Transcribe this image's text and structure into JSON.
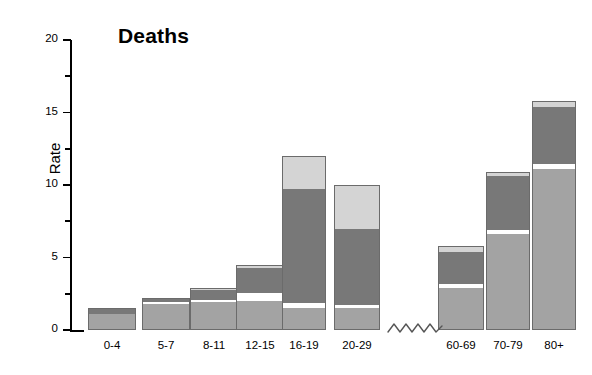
{
  "chart": {
    "title": "Deaths",
    "ylabel": "Rate",
    "y_ticks": [
      "0",
      "5",
      "10",
      "15",
      "20"
    ],
    "y_minor_ticks": [
      "2.5",
      "7.5",
      "12.5",
      "17.5"
    ],
    "axis_break_symbol": "squiggle-wave",
    "colors": {
      "segment_light": "#d4d4d4",
      "segment_dark": "#787878",
      "segment_medium": "#a3a3a3",
      "outline": "#6b6b6b",
      "axis": "#000000",
      "background": "#ffffff"
    }
  },
  "chart_data": {
    "type": "bar",
    "title": "Deaths",
    "xlabel": "",
    "ylabel": "Rate",
    "ylim": [
      0,
      20
    ],
    "grid": false,
    "legend": "none",
    "stacked": true,
    "axis_break_after_category": "20-29",
    "categories": [
      "0-4",
      "5-7",
      "8-11",
      "12-15",
      "16-19",
      "20-29",
      "60-69",
      "70-79",
      "80+"
    ],
    "series": [
      {
        "name": "bottom-segment",
        "color": "#a3a3a3",
        "values": [
          1.1,
          1.8,
          1.9,
          2.0,
          1.5,
          1.5,
          2.9,
          6.6,
          11.1
        ]
      },
      {
        "name": "middle-segment",
        "color": "#787878",
        "values": [
          0.4,
          0.4,
          0.4,
          0.6,
          8.2,
          5.4,
          2.2,
          4.0,
          4.2
        ]
      },
      {
        "name": "top-segment",
        "color": "#d4d4d4",
        "values": [
          0.0,
          0.0,
          0.2,
          1.9,
          2.3,
          3.0,
          0.4,
          0.3,
          0.5
        ]
      }
    ],
    "totals": [
      1.5,
      2.2,
      2.9,
      4.5,
      12.0,
      10.0,
      5.8,
      10.9,
      15.8
    ]
  },
  "bars": [
    {
      "label": "0-4",
      "x": 88,
      "width": 48,
      "total": 1.5,
      "segments": [
        {
          "kind": "medium",
          "from": 0.0,
          "to": 1.1
        },
        {
          "kind": "dark",
          "from": 1.1,
          "to": 1.5
        }
      ]
    },
    {
      "label": "5-7",
      "x": 142,
      "width": 48,
      "total": 2.2,
      "segments": [
        {
          "kind": "medium",
          "from": 0.0,
          "to": 1.8
        },
        {
          "kind": "gap",
          "from": 1.8,
          "to": 1.9
        },
        {
          "kind": "dark",
          "from": 1.9,
          "to": 2.2
        }
      ]
    },
    {
      "label": "8-11",
      "x": 190,
      "width": 48,
      "total": 2.9,
      "segments": [
        {
          "kind": "medium",
          "from": 0.0,
          "to": 1.9
        },
        {
          "kind": "gap",
          "from": 1.9,
          "to": 2.1
        },
        {
          "kind": "dark",
          "from": 2.1,
          "to": 2.75
        },
        {
          "kind": "light",
          "from": 2.75,
          "to": 2.9
        }
      ]
    },
    {
      "label": "12-15",
      "x": 236,
      "width": 48,
      "total": 4.5,
      "segments": [
        {
          "kind": "medium",
          "from": 0.0,
          "to": 2.0
        },
        {
          "kind": "gap",
          "from": 2.0,
          "to": 2.55
        },
        {
          "kind": "dark",
          "from": 2.55,
          "to": 4.3
        },
        {
          "kind": "light",
          "from": 4.3,
          "to": 4.5
        }
      ]
    },
    {
      "label": "16-19",
      "x": 282,
      "width": 44,
      "total": 12.0,
      "segments": [
        {
          "kind": "medium",
          "from": 0.0,
          "to": 1.5
        },
        {
          "kind": "gap",
          "from": 1.5,
          "to": 1.85
        },
        {
          "kind": "dark",
          "from": 1.85,
          "to": 9.7
        },
        {
          "kind": "light",
          "from": 9.7,
          "to": 12.0
        }
      ]
    },
    {
      "label": "20-29",
      "x": 334,
      "width": 46,
      "total": 10.0,
      "segments": [
        {
          "kind": "medium",
          "from": 0.0,
          "to": 1.5
        },
        {
          "kind": "gap",
          "from": 1.5,
          "to": 1.7
        },
        {
          "kind": "dark",
          "from": 1.7,
          "to": 7.0
        },
        {
          "kind": "light",
          "from": 7.0,
          "to": 10.0
        }
      ]
    },
    {
      "label": "60-69",
      "x": 438,
      "width": 46,
      "total": 5.8,
      "segments": [
        {
          "kind": "medium",
          "from": 0.0,
          "to": 2.9
        },
        {
          "kind": "gap",
          "from": 2.9,
          "to": 3.2
        },
        {
          "kind": "dark",
          "from": 3.2,
          "to": 5.4
        },
        {
          "kind": "light",
          "from": 5.4,
          "to": 5.8
        }
      ]
    },
    {
      "label": "70-79",
      "x": 486,
      "width": 44,
      "total": 10.9,
      "segments": [
        {
          "kind": "medium",
          "from": 0.0,
          "to": 6.6
        },
        {
          "kind": "gap",
          "from": 6.6,
          "to": 6.9
        },
        {
          "kind": "dark",
          "from": 6.9,
          "to": 10.6
        },
        {
          "kind": "light",
          "from": 10.6,
          "to": 10.9
        }
      ]
    },
    {
      "label": "80+",
      "x": 532,
      "width": 44,
      "total": 15.8,
      "segments": [
        {
          "kind": "medium",
          "from": 0.0,
          "to": 11.1
        },
        {
          "kind": "gap",
          "from": 11.1,
          "to": 11.45
        },
        {
          "kind": "dark",
          "from": 11.45,
          "to": 15.35
        },
        {
          "kind": "light",
          "from": 15.35,
          "to": 15.8
        }
      ]
    }
  ]
}
